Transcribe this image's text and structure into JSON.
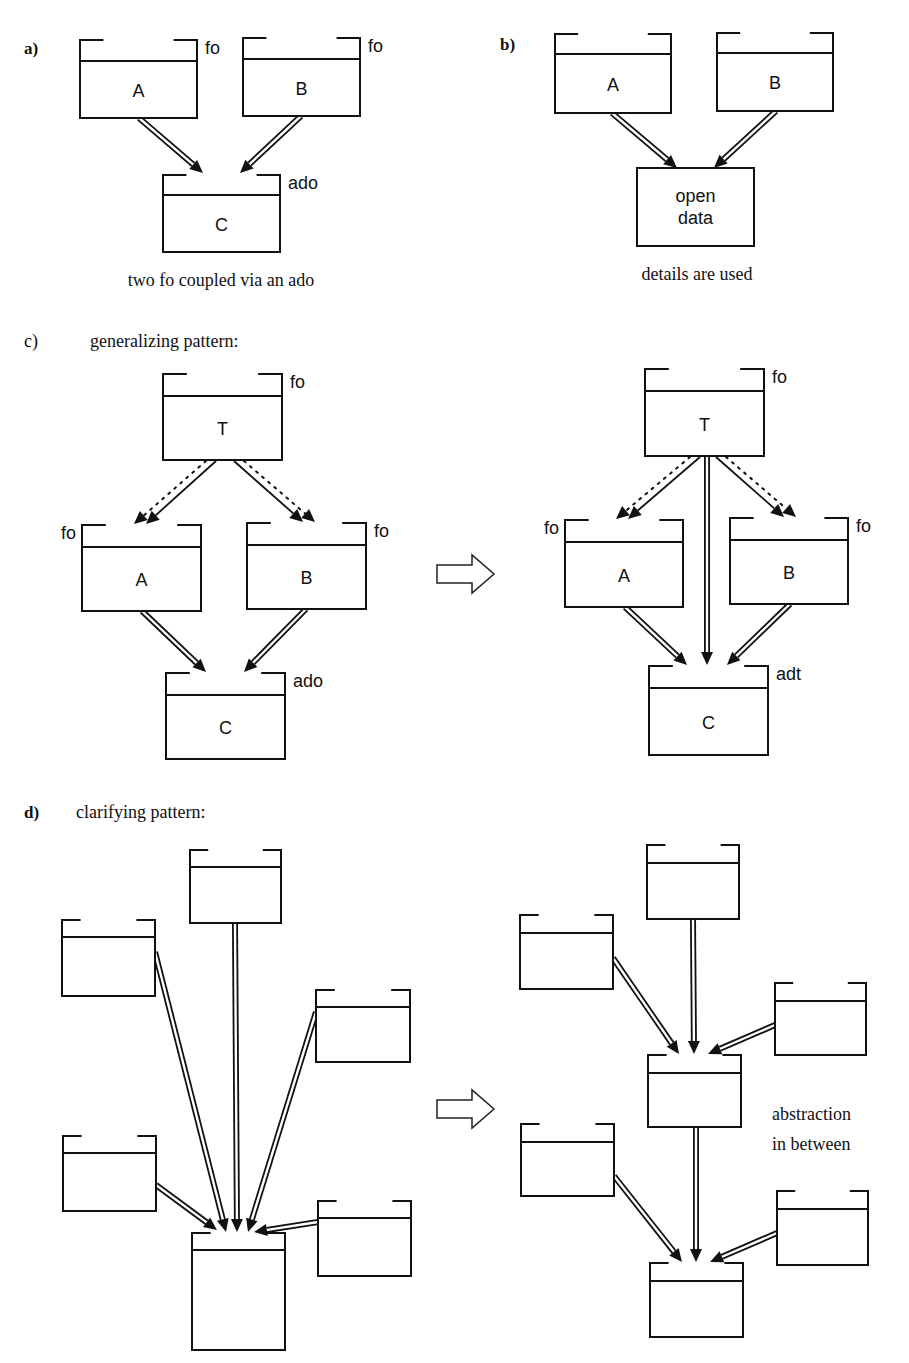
{
  "panels": {
    "a": {
      "label": "a)",
      "caption": "two fo coupled via an ado",
      "boxes": [
        {
          "id": "A",
          "text": "A",
          "tag": "fo",
          "x": 80,
          "y": 40,
          "w": 117,
          "sep": 21,
          "h": 78,
          "tagSide": "right"
        },
        {
          "id": "B",
          "text": "B",
          "tag": "fo",
          "x": 243,
          "y": 38,
          "w": 117,
          "sep": 21,
          "h": 78,
          "tagSide": "right"
        },
        {
          "id": "C",
          "text": "C",
          "tag": "ado",
          "x": 163,
          "y": 175,
          "w": 117,
          "sep": 20,
          "h": 77,
          "tagSide": "right"
        }
      ],
      "edges": [
        {
          "type": "double",
          "x1": 139,
          "y1": 118,
          "x2": 203,
          "y2": 173
        },
        {
          "type": "double",
          "x1": 301,
          "y1": 116,
          "x2": 240,
          "y2": 173
        }
      ]
    },
    "b": {
      "label": "b)",
      "caption": "details are used",
      "boxes": [
        {
          "id": "A",
          "text": "A",
          "tag": "",
          "x": 555,
          "y": 34,
          "w": 116,
          "sep": 20,
          "h": 79,
          "tagSide": "right"
        },
        {
          "id": "B",
          "text": "B",
          "tag": "",
          "x": 717,
          "y": 33,
          "w": 116,
          "sep": 20,
          "h": 78,
          "tagSide": "right"
        }
      ],
      "open_box": {
        "x": 637,
        "y": 168,
        "w": 117,
        "h": 78,
        "lines": [
          "open",
          "data"
        ]
      },
      "edges": [
        {
          "type": "double",
          "x1": 612,
          "y1": 113,
          "x2": 677,
          "y2": 168
        },
        {
          "type": "double",
          "x1": 776,
          "y1": 111,
          "x2": 714,
          "y2": 168
        }
      ]
    },
    "c": {
      "label": "c)",
      "title": "generalizing pattern:",
      "left": {
        "boxes": [
          {
            "id": "T",
            "text": "T",
            "tag": "fo",
            "x": 163,
            "y": 374,
            "w": 119,
            "sep": 22,
            "h": 86,
            "tagSide": "right"
          },
          {
            "id": "A",
            "text": "A",
            "tag": "fo",
            "x": 82,
            "y": 525,
            "w": 119,
            "sep": 22,
            "h": 86,
            "tagSide": "left"
          },
          {
            "id": "B",
            "text": "B",
            "tag": "fo",
            "x": 247,
            "y": 523,
            "w": 119,
            "sep": 22,
            "h": 86,
            "tagSide": "right"
          },
          {
            "id": "C",
            "text": "C",
            "tag": "ado",
            "x": 166,
            "y": 673,
            "w": 119,
            "sep": 22,
            "h": 86,
            "tagSide": "right"
          }
        ],
        "edges": [
          {
            "type": "thin",
            "x1": 216,
            "y1": 461,
            "x2": 146,
            "y2": 524
          },
          {
            "type": "dotted",
            "x1": 206,
            "y1": 461,
            "x2": 134,
            "y2": 524
          },
          {
            "type": "thin",
            "x1": 234,
            "y1": 461,
            "x2": 303,
            "y2": 522
          },
          {
            "type": "dotted",
            "x1": 244,
            "y1": 461,
            "x2": 315,
            "y2": 522
          },
          {
            "type": "double",
            "x1": 142,
            "y1": 611,
            "x2": 206,
            "y2": 672
          },
          {
            "type": "double",
            "x1": 306,
            "y1": 609,
            "x2": 244,
            "y2": 672
          }
        ]
      },
      "transform_arrow": {
        "x": 437,
        "y": 555
      },
      "right": {
        "boxes": [
          {
            "id": "T",
            "text": "T",
            "tag": "fo",
            "x": 645,
            "y": 369,
            "w": 119,
            "sep": 22,
            "h": 87,
            "tagSide": "right"
          },
          {
            "id": "A",
            "text": "A",
            "tag": "fo",
            "x": 565,
            "y": 520,
            "w": 118,
            "sep": 22,
            "h": 87,
            "tagSide": "left"
          },
          {
            "id": "B",
            "text": "B",
            "tag": "fo",
            "x": 730,
            "y": 518,
            "w": 118,
            "sep": 22,
            "h": 86,
            "tagSide": "right"
          },
          {
            "id": "C",
            "text": "C",
            "tag": "adt",
            "x": 649,
            "y": 666,
            "w": 119,
            "sep": 22,
            "h": 89,
            "tagSide": "right"
          }
        ],
        "edges": [
          {
            "type": "thin",
            "x1": 700,
            "y1": 457,
            "x2": 628,
            "y2": 519
          },
          {
            "type": "dotted",
            "x1": 690,
            "y1": 457,
            "x2": 616,
            "y2": 519
          },
          {
            "type": "thin",
            "x1": 716,
            "y1": 457,
            "x2": 784,
            "y2": 517
          },
          {
            "type": "dotted",
            "x1": 726,
            "y1": 457,
            "x2": 796,
            "y2": 517
          },
          {
            "type": "double",
            "x1": 707,
            "y1": 457,
            "x2": 707,
            "y2": 665
          },
          {
            "type": "double",
            "x1": 625,
            "y1": 607,
            "x2": 687,
            "y2": 665
          },
          {
            "type": "double",
            "x1": 790,
            "y1": 604,
            "x2": 727,
            "y2": 665
          }
        ]
      }
    },
    "d": {
      "label": "d)",
      "title": "clarifying pattern:",
      "left": {
        "boxes": [
          {
            "id": "top",
            "x": 190,
            "y": 850,
            "w": 91,
            "sep": 17,
            "h": 73
          },
          {
            "id": "l1",
            "x": 62,
            "y": 920,
            "w": 93,
            "sep": 17,
            "h": 76
          },
          {
            "id": "r1",
            "x": 316,
            "y": 990,
            "w": 94,
            "sep": 17,
            "h": 72
          },
          {
            "id": "l2",
            "x": 63,
            "y": 1136,
            "w": 93,
            "sep": 17,
            "h": 75
          },
          {
            "id": "r2",
            "x": 318,
            "y": 1201,
            "w": 93,
            "sep": 17,
            "h": 75
          },
          {
            "id": "bottom",
            "x": 192,
            "y": 1233,
            "w": 93,
            "sep": 17,
            "h": 117
          }
        ],
        "edges": [
          {
            "type": "double",
            "x1": 235,
            "y1": 923,
            "x2": 237,
            "y2": 1232
          },
          {
            "type": "double",
            "x1": 155,
            "y1": 952,
            "x2": 226,
            "y2": 1232
          },
          {
            "type": "double",
            "x1": 316,
            "y1": 1012,
            "x2": 248,
            "y2": 1232
          },
          {
            "type": "double",
            "x1": 156,
            "y1": 1185,
            "x2": 217,
            "y2": 1230
          },
          {
            "type": "double",
            "x1": 318,
            "y1": 1222,
            "x2": 254,
            "y2": 1232
          }
        ]
      },
      "transform_arrow": {
        "x": 437,
        "y": 1090
      },
      "right": {
        "boxes": [
          {
            "id": "top",
            "x": 647,
            "y": 845,
            "w": 92,
            "sep": 18,
            "h": 74
          },
          {
            "id": "l1",
            "x": 520,
            "y": 915,
            "w": 93,
            "sep": 18,
            "h": 74
          },
          {
            "id": "r1",
            "x": 775,
            "y": 983,
            "w": 91,
            "sep": 18,
            "h": 72
          },
          {
            "id": "mid",
            "x": 648,
            "y": 1055,
            "w": 93,
            "sep": 18,
            "h": 72
          },
          {
            "id": "l2",
            "x": 521,
            "y": 1124,
            "w": 93,
            "sep": 18,
            "h": 72
          },
          {
            "id": "r2",
            "x": 777,
            "y": 1191,
            "w": 91,
            "sep": 18,
            "h": 74
          },
          {
            "id": "bottom",
            "x": 650,
            "y": 1263,
            "w": 93,
            "sep": 18,
            "h": 74
          }
        ],
        "edges": [
          {
            "type": "double",
            "x1": 693,
            "y1": 919,
            "x2": 694,
            "y2": 1054
          },
          {
            "type": "double",
            "x1": 613,
            "y1": 958,
            "x2": 679,
            "y2": 1054
          },
          {
            "type": "double",
            "x1": 775,
            "y1": 1025,
            "x2": 708,
            "y2": 1054
          },
          {
            "type": "double",
            "x1": 696,
            "y1": 1127,
            "x2": 696,
            "y2": 1262
          },
          {
            "type": "double",
            "x1": 614,
            "y1": 1176,
            "x2": 682,
            "y2": 1262
          },
          {
            "type": "double",
            "x1": 777,
            "y1": 1233,
            "x2": 710,
            "y2": 1262
          }
        ],
        "note": [
          "abstraction",
          "in between"
        ]
      }
    }
  }
}
